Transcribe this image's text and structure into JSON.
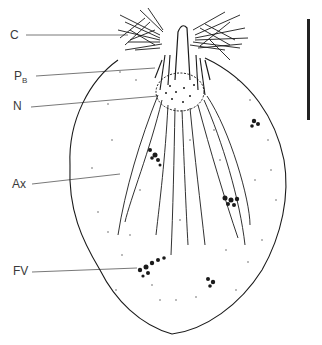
{
  "figure": {
    "labels": [
      {
        "key": "C",
        "text": "C",
        "sub": "",
        "x": 10,
        "y": 29,
        "meaning": "collar / flagellar tuft"
      },
      {
        "key": "PB",
        "text": "P",
        "sub": "B",
        "x": 14,
        "y": 70,
        "meaning": "parabasal body"
      },
      {
        "key": "N",
        "text": "N",
        "sub": "",
        "x": 13,
        "y": 100,
        "meaning": "nucleus"
      },
      {
        "key": "Ax",
        "text": "Ax",
        "sub": "",
        "x": 12,
        "y": 178,
        "meaning": "axostyle / axial fibres"
      },
      {
        "key": "FV",
        "text": "FV",
        "sub": "",
        "x": 13,
        "y": 265,
        "meaning": "food vacuole"
      }
    ],
    "scale_bar": {
      "x": 308,
      "y_top": 19,
      "y_bottom": 120,
      "label": ""
    },
    "colors": {
      "ink": "#1a1a1a",
      "leader": "#555555",
      "background": "#ffffff"
    }
  }
}
